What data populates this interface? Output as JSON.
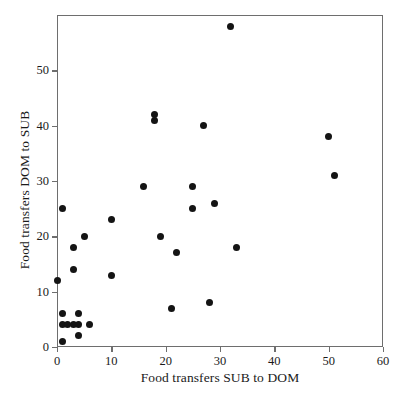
{
  "chart_data": {
    "type": "scatter",
    "title": "",
    "xlabel": "Food transfers SUB to DOM",
    "ylabel": "Food transfers DOM to SUB",
    "xlim": [
      0,
      60
    ],
    "ylim": [
      0,
      60
    ],
    "xticks": [
      0,
      10,
      20,
      30,
      40,
      50,
      60
    ],
    "xtick_labels": [
      "0",
      "10",
      "20",
      "30",
      "40",
      "50",
      "60"
    ],
    "yticks": [
      0,
      10,
      20,
      30,
      40,
      50
    ],
    "ytick_labels": [
      "0",
      "10",
      "20",
      "30",
      "40",
      "50"
    ],
    "grid": false,
    "legend": null,
    "marker": "filled-circle",
    "marker_color": "#141414",
    "frame_color": "#6e6e6e",
    "points": [
      {
        "x": 0,
        "y": 12
      },
      {
        "x": 1,
        "y": 25
      },
      {
        "x": 1,
        "y": 6
      },
      {
        "x": 1,
        "y": 4
      },
      {
        "x": 1,
        "y": 1
      },
      {
        "x": 2,
        "y": 4
      },
      {
        "x": 3,
        "y": 18
      },
      {
        "x": 3,
        "y": 4
      },
      {
        "x": 3,
        "y": 14
      },
      {
        "x": 4,
        "y": 4
      },
      {
        "x": 4,
        "y": 6
      },
      {
        "x": 4,
        "y": 2
      },
      {
        "x": 5,
        "y": 20
      },
      {
        "x": 6,
        "y": 4
      },
      {
        "x": 10,
        "y": 23
      },
      {
        "x": 10,
        "y": 13
      },
      {
        "x": 16,
        "y": 29
      },
      {
        "x": 18,
        "y": 42
      },
      {
        "x": 18,
        "y": 41
      },
      {
        "x": 19,
        "y": 20
      },
      {
        "x": 21,
        "y": 7
      },
      {
        "x": 22,
        "y": 17
      },
      {
        "x": 25,
        "y": 29
      },
      {
        "x": 25,
        "y": 25
      },
      {
        "x": 27,
        "y": 40
      },
      {
        "x": 28,
        "y": 8
      },
      {
        "x": 29,
        "y": 26
      },
      {
        "x": 32,
        "y": 58
      },
      {
        "x": 33,
        "y": 18
      },
      {
        "x": 50,
        "y": 38
      },
      {
        "x": 51,
        "y": 31
      }
    ]
  }
}
